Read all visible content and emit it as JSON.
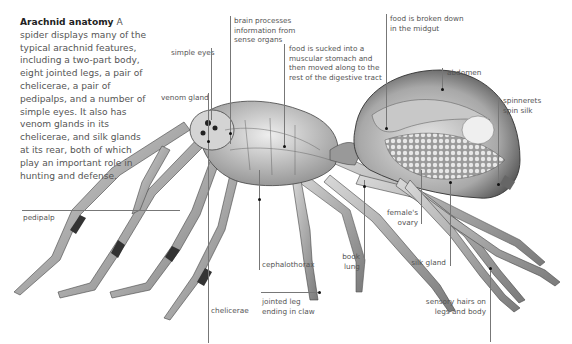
{
  "intro": {
    "title": "Arachnid anatomy",
    "body": "A spider displays many of the typical arachnid features, including a two-part body, eight jointed legs, a pair of chelicerae, a pair of pedipalps, and a number of simple eyes. It also has venom glands in its chelicerae, and silk glands at its rear, both of which play an important role in hunting and defense."
  },
  "labels": {
    "simple_eyes": "simple eyes",
    "venom_gland": "venom gland",
    "brain_1": "brain processes",
    "brain_2": "information from",
    "brain_3": "sense organs",
    "stomach_1": "food is sucked into a",
    "stomach_2": "muscular stomach and",
    "stomach_3": "then moved along to the",
    "stomach_4": "rest of the digestive tract",
    "midgut_1": "food is broken down",
    "midgut_2": "in the midgut",
    "abdomen": "abdomen",
    "spinnerets_1": "spinnerets",
    "spinnerets_2": "spin silk",
    "pedipalp": "pedipalp",
    "chelicerae": "chelicerae",
    "cephalothorax": "cephalothorax",
    "jointed_leg_1": "jointed leg",
    "jointed_leg_2": "ending in claw",
    "book_lung_1": "book",
    "book_lung_2": "lung",
    "ovary_1": "female's",
    "ovary_2": "ovary",
    "silk_gland": "silk gland",
    "sensory_1": "sensory hairs on",
    "sensory_2": "legs and body"
  }
}
